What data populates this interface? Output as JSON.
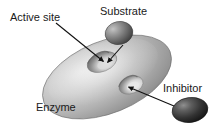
{
  "figure": {
    "background_color": "#ffffff",
    "width": 218,
    "height": 130
  },
  "labels": {
    "active_site": "Active site",
    "substrate": "Substrate",
    "inhibitor": "Inhibitor",
    "enzyme": "Enzyme"
  },
  "colors": {
    "text": "#1a1a1a",
    "enzyme_light": "#d8d8d8",
    "enzyme_mid": "#a8a8a8",
    "enzyme_dark": "#7d7d7d",
    "enzyme_edge": "#6e6e6e",
    "substrate_light": "#b9b9b9",
    "substrate_dark": "#4a4a4a",
    "inhibitor_light": "#8e8e8e",
    "inhibitor_dark": "#232323",
    "pocket_dark": "#6a6a6a",
    "pocket_light": "#e2e2e2",
    "arrow": "#111111"
  },
  "shapes": {
    "enzyme": {
      "name": "enzyme-body",
      "type": "ellipse",
      "cx": 107,
      "cy": 77,
      "rx": 68,
      "ry": 36,
      "rotation_deg": -22
    },
    "active_site_pocket": {
      "name": "active-site-pocket",
      "type": "ellipse",
      "cx": 102,
      "cy": 62,
      "rx": 15,
      "ry": 9,
      "rotation_deg": -22
    },
    "inhibitor_pocket": {
      "name": "inhibitor-site-pocket",
      "type": "ellipse",
      "cx": 131,
      "cy": 85,
      "rx": 12,
      "ry": 8,
      "rotation_deg": -22
    },
    "substrate": {
      "name": "substrate-molecule",
      "type": "ellipse",
      "cx": 119,
      "cy": 33,
      "rx": 14,
      "ry": 11,
      "rotation_deg": -12
    },
    "inhibitor": {
      "name": "inhibitor-molecule",
      "type": "ellipse",
      "cx": 190,
      "cy": 110,
      "rx": 18,
      "ry": 12,
      "rotation_deg": -8
    }
  },
  "arrows": [
    {
      "name": "active-site-arrow",
      "from_label": "Active site",
      "x1": 56,
      "y1": 23,
      "x2": 104,
      "y2": 62
    },
    {
      "name": "substrate-arrow",
      "from_label": "Substrate",
      "x1": 123,
      "y1": 45,
      "x2": 107,
      "y2": 63
    },
    {
      "name": "inhibitor-arrow",
      "from_label": "Inhibitor",
      "x1": 174,
      "y1": 106,
      "x2": 128,
      "y2": 87
    }
  ]
}
